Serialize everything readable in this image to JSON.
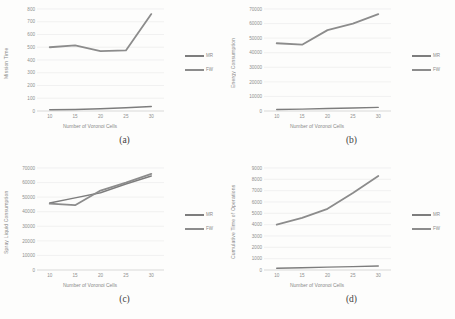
{
  "page": {
    "background": "#fdfdfc",
    "kind": "four-panel line chart figure"
  },
  "colors": {
    "grid": "#eaeaea",
    "axis_line": "#d5d5d5",
    "tick_text": "#8f8f8f",
    "axis_label_text": "#8a8a8a",
    "caption_text": "#3d3d3d",
    "series": {
      "MR": "#7d7d7d",
      "FW": "#8c8c8c"
    }
  },
  "chart_data": [
    {
      "type": "line",
      "panel": "a",
      "caption": "(a)",
      "title": "",
      "xlabel": "Number of Voronoi Cells",
      "ylabel": "Mission Time",
      "x": [
        10,
        15,
        20,
        25,
        30
      ],
      "ylim": [
        0,
        800
      ],
      "ytick_step": 100,
      "grid": true,
      "legend_position": "right",
      "legend": [
        "MR",
        "FW"
      ],
      "series": [
        {
          "name": "MR",
          "values": [
            10,
            12,
            18,
            25,
            35
          ]
        },
        {
          "name": "FW",
          "values": [
            500,
            515,
            470,
            475,
            760
          ]
        }
      ]
    },
    {
      "type": "line",
      "panel": "b",
      "caption": "(b)",
      "title": "",
      "xlabel": "Number of Voronoi Cells",
      "ylabel": "Energy Consumption",
      "x": [
        10,
        15,
        20,
        25,
        30
      ],
      "ylim": [
        0,
        70000
      ],
      "ytick_step": 10000,
      "grid": true,
      "legend_position": "right",
      "legend": [
        "MR",
        "FW"
      ],
      "series": [
        {
          "name": "MR",
          "values": [
            1000,
            1300,
            1700,
            2100,
            2500
          ]
        },
        {
          "name": "FW",
          "values": [
            46500,
            45500,
            55500,
            60000,
            66500
          ]
        }
      ]
    },
    {
      "type": "line",
      "panel": "c",
      "caption": "(c)",
      "title": "",
      "xlabel": "Number of Voronoi Cells",
      "ylabel": "Spray Liquid Consumption",
      "x": [
        10,
        15,
        20,
        25,
        30
      ],
      "ylim": [
        0,
        70000
      ],
      "ytick_step": 10000,
      "grid": true,
      "legend_position": "right",
      "legend": [
        "MR",
        "FW"
      ],
      "series": [
        {
          "name": "MR",
          "values": [
            46000,
            49500,
            53000,
            59000,
            64500
          ]
        },
        {
          "name": "FW",
          "values": [
            45500,
            44500,
            54500,
            60000,
            66000
          ]
        }
      ]
    },
    {
      "type": "line",
      "panel": "d",
      "caption": "(d)",
      "title": "",
      "xlabel": "Number of Voronoi Cells",
      "ylabel": "Cumulative Time of Operations",
      "x": [
        10,
        15,
        20,
        25,
        30
      ],
      "ylim": [
        0,
        9000
      ],
      "ytick_step": 1000,
      "grid": true,
      "legend_position": "right",
      "legend": [
        "MR",
        "FW"
      ],
      "series": [
        {
          "name": "MR",
          "values": [
            150,
            200,
            250,
            300,
            350
          ]
        },
        {
          "name": "FW",
          "values": [
            4000,
            4600,
            5400,
            6800,
            8300
          ]
        }
      ]
    }
  ]
}
